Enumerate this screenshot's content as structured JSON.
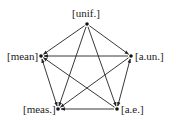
{
  "nodes": [
    {
      "id": "unif",
      "label": "[unif.]",
      "x": 87,
      "y": 24,
      "lx": 72,
      "ly": 8
    },
    {
      "id": "mean",
      "label": "[mean]",
      "x": 41,
      "y": 56,
      "lx": 7,
      "ly": 51
    },
    {
      "id": "aun",
      "label": "[a.un.]",
      "x": 131,
      "y": 56,
      "lx": 135,
      "ly": 51
    },
    {
      "id": "meas",
      "label": "[meas.]",
      "x": 58,
      "y": 109,
      "lx": 23,
      "ly": 104
    },
    {
      "id": "ae",
      "label": "[a.e.]",
      "x": 117,
      "y": 109,
      "lx": 121,
      "ly": 104
    }
  ],
  "edges": [
    {
      "from": "unif",
      "to": "mean",
      "double": false
    },
    {
      "from": "unif",
      "to": "aun",
      "double": false
    },
    {
      "from": "unif",
      "to": "meas",
      "double": false
    },
    {
      "from": "unif",
      "to": "ae",
      "double": false
    },
    {
      "from": "aun",
      "to": "mean",
      "double": false
    },
    {
      "from": "aun",
      "to": "meas",
      "double": false
    },
    {
      "from": "aun",
      "to": "ae",
      "double": true
    },
    {
      "from": "mean",
      "to": "meas",
      "double": true
    },
    {
      "from": "ae",
      "to": "mean",
      "double": false
    },
    {
      "from": "ae",
      "to": "meas",
      "double": false
    }
  ]
}
